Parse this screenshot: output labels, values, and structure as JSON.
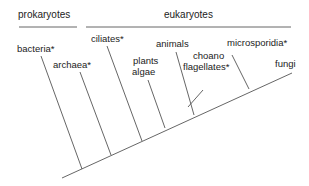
{
  "diagram": {
    "type": "phylogenetic-tree",
    "groups": [
      {
        "label": "prokaryotes",
        "x": 18,
        "y": 11,
        "bar": [
          19,
          77,
          27
        ]
      },
      {
        "label": "eukaryotes",
        "x": 164,
        "y": 11,
        "bar": [
          86,
          291,
          27
        ]
      }
    ],
    "taxa": [
      {
        "id": "bacteria",
        "label": "bacteria*"
      },
      {
        "id": "archaea",
        "label": "archaea*"
      },
      {
        "id": "ciliates",
        "label": "ciliates*"
      },
      {
        "id": "plants",
        "label": "plants"
      },
      {
        "id": "algae",
        "label": "algae"
      },
      {
        "id": "animals",
        "label": "animals"
      },
      {
        "id": "choano",
        "label": "choano"
      },
      {
        "id": "flagellates",
        "label": "flagellates*"
      },
      {
        "id": "microsporidia",
        "label": "microsporidia*"
      },
      {
        "id": "fungi",
        "label": "fungi"
      }
    ],
    "line_color": "#555555",
    "text_color": "#222222"
  }
}
